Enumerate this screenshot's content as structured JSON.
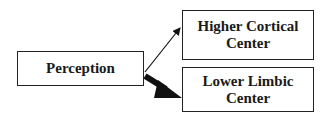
{
  "diagram": {
    "nodes": [
      {
        "id": "perception",
        "label": "Perception"
      },
      {
        "id": "higher",
        "label_line1": "Higher Cortical",
        "label_line2": "Center"
      },
      {
        "id": "lower",
        "label_line1": "Lower Limbic",
        "label_line2": "Center"
      }
    ],
    "edges": [
      {
        "from": "perception",
        "to": "higher",
        "style": "thin"
      },
      {
        "from": "perception",
        "to": "lower",
        "style": "thick"
      }
    ],
    "colors": {
      "stroke": "#222222",
      "arrow": "#111111",
      "background": "#ffffff"
    }
  }
}
